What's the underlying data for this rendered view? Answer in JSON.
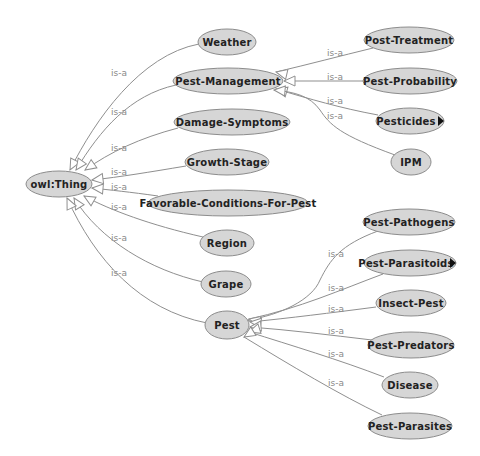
{
  "diagram": {
    "type": "ontology-graph",
    "edge_label": "is-a",
    "colors": {
      "node_fill": "#d6d6d6",
      "node_stroke": "#8c8c8c",
      "edge": "#8f8f8f",
      "edge_label": "#8a8a8a",
      "text": "#222222"
    },
    "root": {
      "id": "owl-thing",
      "label": "owl:Thing",
      "cx": 59,
      "cy": 184,
      "rx": 33,
      "ry": 13
    },
    "nodes": [
      {
        "id": "weather",
        "label": "Weather",
        "cx": 227,
        "cy": 42,
        "rx": 29,
        "ry": 13,
        "parent": "owl-thing"
      },
      {
        "id": "pest-management",
        "label": "Pest-Management",
        "cx": 228,
        "cy": 81,
        "rx": 55,
        "ry": 13,
        "parent": "owl-thing"
      },
      {
        "id": "damage-symptoms",
        "label": "Damage-Symptoms",
        "cx": 232,
        "cy": 122,
        "rx": 58,
        "ry": 13,
        "parent": "owl-thing"
      },
      {
        "id": "growth-stage",
        "label": "Growth-Stage",
        "cx": 227,
        "cy": 162,
        "rx": 42,
        "ry": 13,
        "parent": "owl-thing"
      },
      {
        "id": "favorable-conditions-for-pest",
        "label": "Favorable-Conditions-For-Pest",
        "cx": 228,
        "cy": 203,
        "rx": 80,
        "ry": 13,
        "parent": "owl-thing"
      },
      {
        "id": "region",
        "label": "Region",
        "cx": 227,
        "cy": 243,
        "rx": 27,
        "ry": 13,
        "parent": "owl-thing"
      },
      {
        "id": "grape",
        "label": "Grape",
        "cx": 226,
        "cy": 284,
        "rx": 25,
        "ry": 13,
        "parent": "owl-thing"
      },
      {
        "id": "pest",
        "label": "Pest",
        "cx": 227,
        "cy": 325,
        "rx": 22,
        "ry": 14,
        "parent": "owl-thing"
      },
      {
        "id": "post-treatment",
        "label": "Post-Treatment",
        "cx": 409,
        "cy": 40,
        "rx": 45,
        "ry": 13,
        "parent": "pest-management"
      },
      {
        "id": "pest-probability",
        "label": "Pest-Probability",
        "cx": 410,
        "cy": 81,
        "rx": 47,
        "ry": 13,
        "parent": "pest-management"
      },
      {
        "id": "pesticides",
        "label": "Pesticides",
        "cx": 410,
        "cy": 121,
        "rx": 34,
        "ry": 13,
        "parent": "pest-management",
        "expandable": true
      },
      {
        "id": "ipm",
        "label": "IPM",
        "cx": 411,
        "cy": 162,
        "rx": 20,
        "ry": 13,
        "parent": "pest-management"
      },
      {
        "id": "pest-pathogens",
        "label": "Pest-Pathogens",
        "cx": 409,
        "cy": 222,
        "rx": 46,
        "ry": 13,
        "parent": "pest"
      },
      {
        "id": "pest-parasitoids",
        "label": "Pest-Parasitoids",
        "cx": 410,
        "cy": 263,
        "rx": 46,
        "ry": 13,
        "parent": "pest",
        "expandable": true
      },
      {
        "id": "insect-pest",
        "label": "Insect-Pest",
        "cx": 411,
        "cy": 303,
        "rx": 35,
        "ry": 13,
        "parent": "pest"
      },
      {
        "id": "pest-predators",
        "label": "Pest-Predators",
        "cx": 411,
        "cy": 345,
        "rx": 43,
        "ry": 13,
        "parent": "pest"
      },
      {
        "id": "disease",
        "label": "Disease",
        "cx": 410,
        "cy": 385,
        "rx": 28,
        "ry": 13,
        "parent": "pest"
      },
      {
        "id": "pest-parasites",
        "label": "Pest-Parasites",
        "cx": 410,
        "cy": 426,
        "rx": 42,
        "ry": 13,
        "parent": "pest"
      }
    ],
    "edges": [
      {
        "from": "weather",
        "to": "owl-thing",
        "d": "M199,44 C140,55 95,120 70,170",
        "arrow": [
          70,
          170
        ],
        "angle": 118,
        "label_x": 111,
        "label_y": 76
      },
      {
        "from": "pest-management",
        "to": "owl-thing",
        "d": "M176,85 C130,95 100,130 76,170",
        "arrow": [
          76,
          170
        ],
        "angle": 125,
        "label_x": 111,
        "label_y": 115
      },
      {
        "from": "damage-symptoms",
        "to": "owl-thing",
        "d": "M178,128 C140,138 110,152 85,170",
        "arrow": [
          85,
          170
        ],
        "angle": 145,
        "label_x": 111,
        "label_y": 151
      },
      {
        "from": "growth-stage",
        "to": "owl-thing",
        "d": "M186,166 C150,172 120,177 92,180",
        "arrow": [
          92,
          180
        ],
        "angle": 173,
        "label_x": 111,
        "label_y": 175
      },
      {
        "from": "favorable-conditions-for-pest",
        "to": "owl-thing",
        "d": "M158,196 C130,192 110,190 92,188",
        "arrow": [
          92,
          188
        ],
        "angle": 185,
        "label_x": 111,
        "label_y": 190
      },
      {
        "from": "region",
        "to": "owl-thing",
        "d": "M203,237 C150,225 110,210 84,196",
        "arrow": [
          84,
          196
        ],
        "angle": 210,
        "label_x": 111,
        "label_y": 210
      },
      {
        "from": "grape",
        "to": "owl-thing",
        "d": "M203,282 C150,270 100,240 74,198",
        "arrow": [
          74,
          198
        ],
        "angle": 238,
        "label_x": 111,
        "label_y": 241
      },
      {
        "from": "pest",
        "to": "owl-thing",
        "d": "M207,323 C140,310 95,260 67,198",
        "arrow": [
          67,
          198
        ],
        "angle": 245,
        "label_x": 111,
        "label_y": 276
      },
      {
        "from": "post-treatment",
        "to": "pest-management",
        "d": "M373,48 C340,56 310,64 276,72",
        "arrow": [
          276,
          72
        ],
        "angle": 193,
        "label_x": 327,
        "label_y": 56
      },
      {
        "from": "pest-probability",
        "to": "pest-management",
        "d": "M363,81 L284,81",
        "arrow": [
          284,
          81
        ],
        "angle": 180,
        "label_x": 327,
        "label_y": 80
      },
      {
        "from": "pesticides",
        "to": "pest-management",
        "d": "M378,115 C340,108 310,99 276,89",
        "arrow": [
          276,
          89
        ],
        "angle": 196,
        "label_x": 327,
        "label_y": 104
      },
      {
        "from": "ipm",
        "to": "pest-management",
        "d": "M395,155 C340,135 330,125 320,110 C310,96 295,92 274,90",
        "arrow": [
          274,
          90
        ],
        "angle": 185,
        "label_x": 327,
        "label_y": 119
      },
      {
        "from": "pest-pathogens",
        "to": "pest",
        "d": "M378,231 C340,245 330,260 320,280 C312,300 280,315 248,320",
        "arrow": [
          248,
          320
        ],
        "angle": 190,
        "label_x": 328,
        "label_y": 257
      },
      {
        "from": "pest-parasitoids",
        "to": "pest",
        "d": "M383,274 C340,290 300,308 249,319",
        "arrow": [
          249,
          319
        ],
        "angle": 193,
        "label_x": 328,
        "label_y": 291
      },
      {
        "from": "insect-pest",
        "to": "pest",
        "d": "M376,307 C330,313 290,318 250,322",
        "arrow": [
          250,
          322
        ],
        "angle": 186,
        "label_x": 328,
        "label_y": 312
      },
      {
        "from": "pest-predators",
        "to": "pest",
        "d": "M372,340 C330,335 290,330 250,327",
        "arrow": [
          250,
          327
        ],
        "angle": 175,
        "label_x": 328,
        "label_y": 334
      },
      {
        "from": "disease",
        "to": "pest",
        "d": "M384,377 C340,360 290,345 249,332",
        "arrow": [
          249,
          332
        ],
        "angle": 162,
        "label_x": 328,
        "label_y": 357
      },
      {
        "from": "pest-parasites",
        "to": "pest",
        "d": "M382,415 C340,395 290,365 244,337",
        "arrow": [
          244,
          337
        ],
        "angle": 148,
        "label_x": 328,
        "label_y": 386
      }
    ]
  }
}
